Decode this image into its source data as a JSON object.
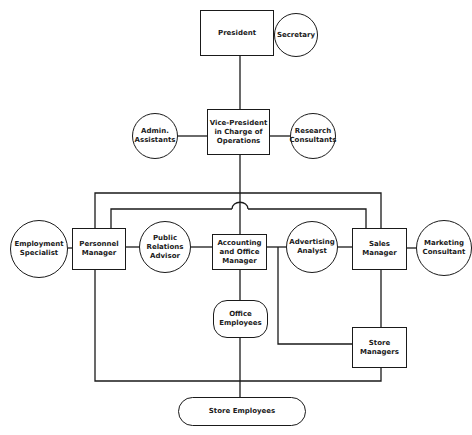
{
  "diagram": {
    "type": "organization-chart",
    "nodes": {
      "president": "President",
      "secretary": "Secretary",
      "vice_president": "Vice-President\nin Charge of\nOperations",
      "admin_assistants": "Admin.\nAssistants",
      "research_consultants": "Research\nConsultants",
      "employment_specialist": "Employment\nSpecialist",
      "personnel_manager": "Personnel\nManager",
      "public_relations_advisor": "Public\nRelations\nAdvisor",
      "accounting_office_manager": "Accounting\nand Office\nManager",
      "advertising_analyst": "Advertising\nAnalyst",
      "sales_manager": "Sales\nManager",
      "marketing_consultant": "Marketing\nConsultant",
      "office_employees": "Office\nEmployees",
      "store_managers": "Store\nManagers",
      "store_employees": "Store Employees"
    },
    "edges": [
      [
        "President",
        "Secretary"
      ],
      [
        "President",
        "Vice-President in Charge of Operations"
      ],
      [
        "Admin. Assistants",
        "Vice-President in Charge of Operations"
      ],
      [
        "Vice-President in Charge of Operations",
        "Research Consultants"
      ],
      [
        "Vice-President in Charge of Operations",
        "Accounting and Office Manager"
      ],
      [
        "Vice-President in Charge of Operations",
        "Personnel Manager"
      ],
      [
        "Vice-President in Charge of Operations",
        "Sales Manager"
      ],
      [
        "Personnel Manager",
        "Sales Manager"
      ],
      [
        "Employment Specialist",
        "Personnel Manager"
      ],
      [
        "Personnel Manager",
        "Public Relations Advisor"
      ],
      [
        "Public Relations Advisor",
        "Accounting and Office Manager"
      ],
      [
        "Accounting and Office Manager",
        "Advertising Analyst"
      ],
      [
        "Advertising Analyst",
        "Sales Manager"
      ],
      [
        "Sales Manager",
        "Marketing Consultant"
      ],
      [
        "Accounting and Office Manager",
        "Office Employees"
      ],
      [
        "Accounting and Office Manager",
        "Store Managers"
      ],
      [
        "Sales Manager",
        "Store Managers"
      ],
      [
        "Office Employees",
        "Store Employees"
      ],
      [
        "Personnel Manager",
        "Store Employees"
      ],
      [
        "Store Managers",
        "Store Employees"
      ]
    ]
  }
}
